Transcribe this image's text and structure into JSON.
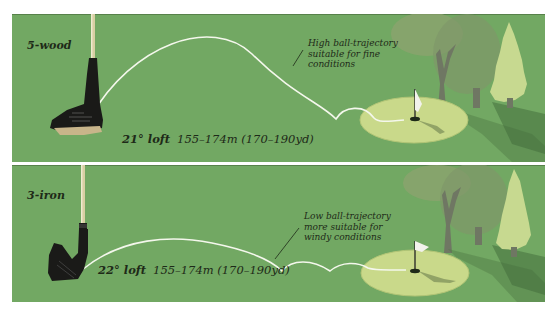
{
  "figure": {
    "colors": {
      "fairway": "#72a863",
      "green": "#c9d98a",
      "green_edge": "#b7ca79",
      "trajectory": "#f4f7ec",
      "text": "#1e2a18",
      "club_head": "#1a1a18",
      "shaft": "#d8cfa4",
      "tree_light": "#c7d990",
      "tree_mid": "#8ea36f",
      "tree_dark": "#7b8a62",
      "trunk": "#6f7763",
      "shadow": "#4f7a44"
    },
    "panels": [
      {
        "id": "top",
        "club": "5-wood",
        "club_type_icon": "fairway-wood-icon",
        "loft": "21° loft",
        "distance": "155–174m (170–190yd)",
        "annotation": {
          "lines": [
            "High ball-trajectory",
            "suitable for fine",
            "conditions"
          ]
        },
        "trajectory": "high"
      },
      {
        "id": "bottom",
        "club": "3-iron",
        "club_type_icon": "iron-club-icon",
        "loft": "22° loft",
        "distance": "155–174m (170–190yd)",
        "annotation": {
          "lines": [
            "Low ball-trajectory",
            "more suitable for",
            "windy conditions"
          ]
        },
        "trajectory": "low"
      }
    ]
  }
}
